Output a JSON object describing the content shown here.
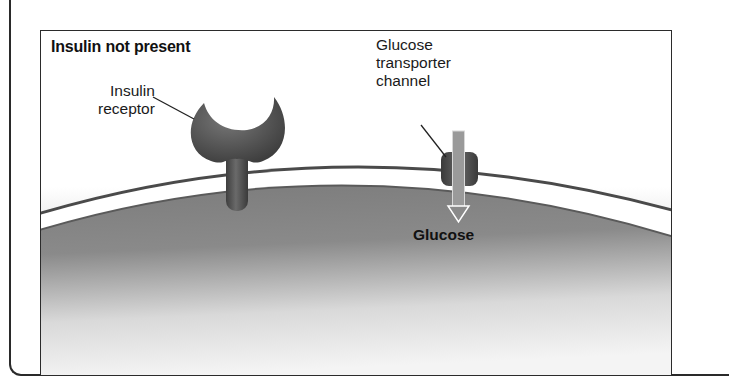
{
  "panel": {
    "title": "Insulin not present"
  },
  "labels": {
    "insulin_receptor": [
      "Insulin",
      "receptor"
    ],
    "glucose_transporter": [
      "Glucose",
      "transporter",
      "channel"
    ],
    "glucose": "Glucose"
  },
  "colors": {
    "extracellular_top": "#ffffff",
    "extracellular_bottom": "#d9d9d9",
    "membrane_outline": "#4a4a4a",
    "membrane_band": "#ffffff",
    "cytoplasm_top": "#7a7a7a",
    "cytoplasm_bottom": "#f2f2f2",
    "receptor": "#555555",
    "transporter": "#4d4d4d",
    "arrow_fill": "#9a9a9a",
    "arrow_outline": "#ffffff",
    "frame": "#2b2b2b"
  }
}
